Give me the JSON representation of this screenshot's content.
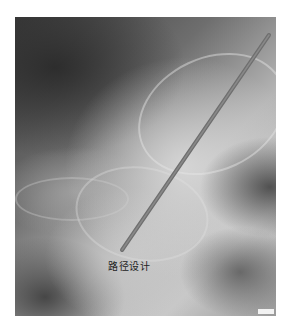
{
  "image": {
    "description": "Lateral radiograph (X-ray) with a planned trajectory line overlay",
    "annotation": {
      "label": "路径设计",
      "line": {
        "x1": 269,
        "y1": 35,
        "x2": 122,
        "y2": 250,
        "color": "#6f6f6f",
        "width": 4
      }
    },
    "colors": {
      "background": "#ffffff",
      "label_text": "#222222"
    }
  }
}
